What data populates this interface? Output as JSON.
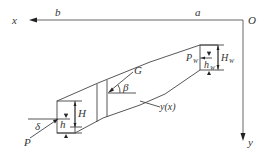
{
  "diagram": {
    "type": "Diagram",
    "axes": {
      "origin_label": "O",
      "x_label": "x",
      "y_label": "y",
      "x_marks": [
        "a",
        "b"
      ]
    },
    "right_block": {
      "force_label": "P",
      "force_sub": "W",
      "height_label": "H",
      "height_sub": "W",
      "depth_label": "h",
      "depth_sub": "W"
    },
    "left_block": {
      "force_label": "P",
      "angle_label": "δ",
      "height_label": "H",
      "depth_label": "h"
    },
    "gravity": {
      "label": "G",
      "angle_label": "β"
    },
    "curve_label": "y(x)",
    "colors": {
      "line": "#444444",
      "text": "#333333",
      "background": "#ffffff"
    }
  }
}
